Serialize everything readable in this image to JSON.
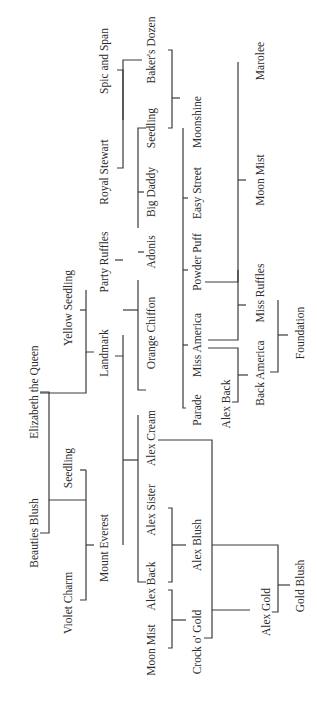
{
  "diagram": {
    "type": "pedigree-tree",
    "orientation": "rotated-90-ccw",
    "nodes": [
      {
        "id": "elizabeth",
        "label": "Elizabeth the Queen",
        "x": 34,
        "y": 392
      },
      {
        "id": "beauties",
        "label": "Beauties Blush",
        "x": 34,
        "y": 533
      },
      {
        "id": "yellowseedling",
        "label": "Yellow Seedling",
        "x": 68,
        "y": 308
      },
      {
        "id": "seedling1",
        "label": "Seedling",
        "x": 68,
        "y": 468
      },
      {
        "id": "violet",
        "label": "Violet Charm",
        "x": 68,
        "y": 603
      },
      {
        "id": "spic",
        "label": "Spic and Span",
        "x": 104,
        "y": 61
      },
      {
        "id": "royal",
        "label": "Royal Stewart",
        "x": 104,
        "y": 172
      },
      {
        "id": "party",
        "label": "Party Ruffles",
        "x": 104,
        "y": 262
      },
      {
        "id": "landmark",
        "label": "Landmark",
        "x": 104,
        "y": 353
      },
      {
        "id": "everest",
        "label": "Mount Everest",
        "x": 104,
        "y": 548
      },
      {
        "id": "bakers",
        "label": "Baker's Dozen",
        "x": 151,
        "y": 50
      },
      {
        "id": "seedling2",
        "label": "Seedling",
        "x": 151,
        "y": 128
      },
      {
        "id": "bigdaddy",
        "label": "Big Daddy",
        "x": 151,
        "y": 192
      },
      {
        "id": "adonis",
        "label": "Adonis",
        "x": 151,
        "y": 252
      },
      {
        "id": "orange",
        "label": "Orange Chiffon",
        "x": 151,
        "y": 333
      },
      {
        "id": "alexcream",
        "label": "Alex Cream",
        "x": 151,
        "y": 438
      },
      {
        "id": "alexsister",
        "label": "Alex Sister",
        "x": 151,
        "y": 510
      },
      {
        "id": "alexback1",
        "label": "Alex Back",
        "x": 151,
        "y": 586
      },
      {
        "id": "moonmist1",
        "label": "Moon Mist",
        "x": 151,
        "y": 650
      },
      {
        "id": "moonshine",
        "label": "Moonshine",
        "x": 197,
        "y": 122
      },
      {
        "id": "easystreet",
        "label": "Easy Street",
        "x": 197,
        "y": 193
      },
      {
        "id": "powderpuff",
        "label": "Powder Puff",
        "x": 197,
        "y": 262
      },
      {
        "id": "missamerica",
        "label": "Miss America",
        "x": 197,
        "y": 345
      },
      {
        "id": "parade",
        "label": "Parade",
        "x": 197,
        "y": 410
      },
      {
        "id": "alexblush",
        "label": "Alex Blush",
        "x": 197,
        "y": 545
      },
      {
        "id": "crock",
        "label": "Crock o' Gold",
        "x": 197,
        "y": 642
      },
      {
        "id": "alexback2",
        "label": "Alex Back",
        "x": 226,
        "y": 404
      },
      {
        "id": "marolee",
        "label": "Marolee",
        "x": 260,
        "y": 61
      },
      {
        "id": "moonmist2",
        "label": "Moon Mist",
        "x": 260,
        "y": 180
      },
      {
        "id": "missruffles",
        "label": "Miss Ruffles",
        "x": 260,
        "y": 293
      },
      {
        "id": "backamerica",
        "label": "Back America",
        "x": 260,
        "y": 373
      },
      {
        "id": "alexgold",
        "label": "Alex Gold",
        "x": 266,
        "y": 612
      },
      {
        "id": "foundation",
        "label": "Foundation",
        "x": 300,
        "y": 333
      },
      {
        "id": "goldblush",
        "label": "Gold Blush",
        "x": 300,
        "y": 586
      }
    ],
    "edges": [
      "M117,70 H123 V168 H117",
      "M123,120 V60 H142",
      "M86,500 H49 V392 H40",
      "M49,500 V533 H40",
      "M86,290 V352 H94",
      "M80,310 H86",
      "M86,352 V393 H40",
      "M86,470 H80",
      "M86,470 V600 H80",
      "M86,545 H94",
      "M123,545 V356 H115",
      "M123,356 V335",
      "M123,310 H138",
      "M138,280 V390 H146",
      "M123,260 H115",
      "M138,228 V128 H146",
      "M138,192 H144",
      "M138,252 H144",
      "M123,460 H138",
      "M138,415 V582 H146",
      "M168,50 H172 V128 H168",
      "M172,98 H180",
      "M183,128 V408 H186",
      "M183,198 H188",
      "M183,270 H188",
      "M183,345 H188",
      "M168,508 H172 V582 H168",
      "M172,545 H186",
      "M168,590 H172 V648 H168",
      "M172,620 H186",
      "M158,440 H212 V638 H204",
      "M212,610 H250",
      "M212,545 H278 V612 H272",
      "M278,585 H290",
      "M238,62 V282 H205",
      "M238,180 H246",
      "M238,270 V340 H208",
      "M238,305 H246",
      "M208,348 H238 V402 H232",
      "M238,375 H248",
      "M278,300 V372 H270",
      "M278,335 H288"
    ]
  }
}
